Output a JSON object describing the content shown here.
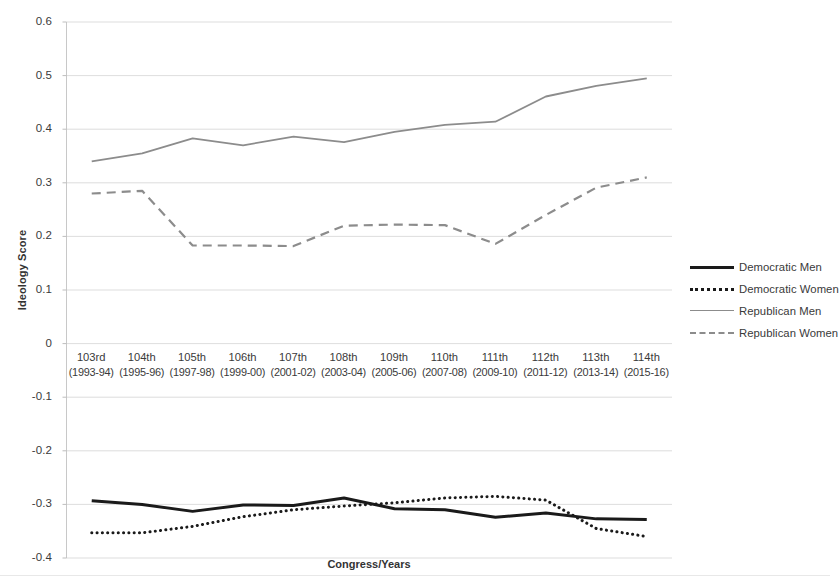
{
  "chart_data": {
    "type": "line",
    "title": "",
    "xlabel": "Congress/Years",
    "ylabel": "Ideology Score",
    "ylim": [
      -0.4,
      0.6
    ],
    "ytick_labels": [
      "0.6",
      "0.5",
      "0.4",
      "0.3",
      "0.2",
      "0.1",
      "0",
      "-0.1",
      "-0.2",
      "-0.3",
      "-0.4"
    ],
    "ytick_values": [
      0.6,
      0.5,
      0.4,
      0.3,
      0.2,
      0.1,
      0,
      -0.1,
      -0.2,
      -0.3,
      -0.4
    ],
    "grid": true,
    "grid_axis": "y",
    "legend_position": "right",
    "categories": [
      "103rd",
      "104th",
      "105th",
      "106th",
      "107th",
      "108th",
      "109th",
      "110th",
      "111th",
      "112th",
      "113th",
      "114th"
    ],
    "category_years": [
      "(1993-94)",
      "(1995-96)",
      "(1997-98)",
      "(1999-00)",
      "(2001-02)",
      "(2003-04)",
      "(2005-06)",
      "(2007-08)",
      "(2009-10)",
      "(2011-12)",
      "(2013-14)",
      "(2015-16)"
    ],
    "series": [
      {
        "name": "Democratic Men",
        "style": "solid",
        "color": "#1a1a1a",
        "width": 3,
        "values": [
          -0.293,
          -0.3,
          -0.313,
          -0.301,
          -0.302,
          -0.288,
          -0.308,
          -0.31,
          -0.324,
          -0.316,
          -0.327,
          -0.328
        ]
      },
      {
        "name": "Democratic Women",
        "style": "dotted",
        "color": "#1a1a1a",
        "width": 3,
        "values": [
          -0.353,
          -0.353,
          -0.341,
          -0.323,
          -0.31,
          -0.303,
          -0.297,
          -0.288,
          -0.285,
          -0.292,
          -0.345,
          -0.36
        ]
      },
      {
        "name": "Republican Men",
        "style": "solid",
        "color": "#8c8c8c",
        "width": 1.8,
        "values": [
          0.34,
          0.355,
          0.383,
          0.37,
          0.386,
          0.376,
          0.395,
          0.408,
          0.414,
          0.461,
          0.481,
          0.495
        ]
      },
      {
        "name": "Republican Women",
        "style": "dashed",
        "color": "#8c8c8c",
        "width": 2.2,
        "values": [
          0.28,
          0.285,
          0.183,
          0.183,
          0.182,
          0.22,
          0.222,
          0.221,
          0.186,
          0.24,
          0.291,
          0.31
        ]
      }
    ]
  },
  "legend": {
    "items": [
      {
        "label": "Democratic Men"
      },
      {
        "label": "Democratic Women"
      },
      {
        "label": "Republican Men"
      },
      {
        "label": "Republican Women"
      }
    ]
  },
  "axis_titles": {
    "y": "Ideology Score",
    "x": "Congress/Years"
  }
}
